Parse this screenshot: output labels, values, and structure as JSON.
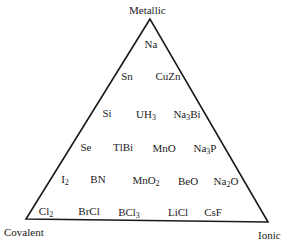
{
  "diagram": {
    "type": "van-arkel-ketelaar-triangle",
    "vertices": {
      "top": "Metallic",
      "bottom_left": "Covalent",
      "bottom_right": "Ionic"
    },
    "line_color": "#1a1a1a",
    "compounds": [
      {
        "id": "Na",
        "base": "Na",
        "parts": [
          [
            "Na",
            ""
          ]
        ],
        "x": 151,
        "y": 44
      },
      {
        "id": "Sn",
        "parts": [
          [
            "Sn",
            ""
          ]
        ],
        "x": 127,
        "y": 76
      },
      {
        "id": "CuZn",
        "parts": [
          [
            "CuZn",
            ""
          ]
        ],
        "x": 168,
        "y": 76
      },
      {
        "id": "Si",
        "parts": [
          [
            "Si",
            ""
          ]
        ],
        "x": 107,
        "y": 113
      },
      {
        "id": "UH3",
        "parts": [
          [
            "UH",
            "3"
          ]
        ],
        "x": 146,
        "y": 114
      },
      {
        "id": "Na3Bi",
        "parts": [
          [
            "Na",
            "3"
          ],
          [
            "Bi",
            ""
          ]
        ],
        "x": 187,
        "y": 114
      },
      {
        "id": "Se",
        "parts": [
          [
            "Se",
            ""
          ]
        ],
        "x": 86,
        "y": 147
      },
      {
        "id": "TlBi",
        "parts": [
          [
            "TlBi",
            ""
          ]
        ],
        "x": 123,
        "y": 147
      },
      {
        "id": "MnO",
        "parts": [
          [
            "MnO",
            ""
          ]
        ],
        "x": 164,
        "y": 148
      },
      {
        "id": "Na3P",
        "parts": [
          [
            "Na",
            "3"
          ],
          [
            "P",
            ""
          ]
        ],
        "x": 205,
        "y": 148
      },
      {
        "id": "I2",
        "parts": [
          [
            "I",
            "2"
          ]
        ],
        "x": 65,
        "y": 179
      },
      {
        "id": "BN",
        "parts": [
          [
            "BN",
            ""
          ]
        ],
        "x": 98,
        "y": 179
      },
      {
        "id": "MnO2",
        "parts": [
          [
            "MnO",
            "2"
          ]
        ],
        "x": 146,
        "y": 180
      },
      {
        "id": "BeO",
        "parts": [
          [
            "BeO",
            ""
          ]
        ],
        "x": 188,
        "y": 181
      },
      {
        "id": "Na2O",
        "parts": [
          [
            "Na",
            "2"
          ],
          [
            "O",
            ""
          ]
        ],
        "x": 226,
        "y": 181
      },
      {
        "id": "Cl2",
        "parts": [
          [
            "Cl",
            "2"
          ]
        ],
        "x": 46,
        "y": 211
      },
      {
        "id": "BrCl",
        "parts": [
          [
            "BrCl",
            ""
          ]
        ],
        "x": 89,
        "y": 211
      },
      {
        "id": "BCl3",
        "parts": [
          [
            "BCl",
            "3"
          ]
        ],
        "x": 129,
        "y": 212
      },
      {
        "id": "LiCl",
        "parts": [
          [
            "LiCl",
            ""
          ]
        ],
        "x": 178,
        "y": 212
      },
      {
        "id": "CsF",
        "parts": [
          [
            "CsF",
            ""
          ]
        ],
        "x": 213,
        "y": 212
      }
    ]
  }
}
